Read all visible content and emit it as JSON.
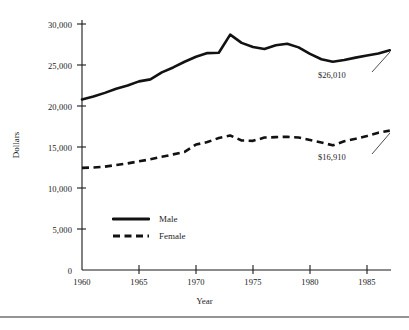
{
  "chart_data": {
    "type": "line",
    "title": "",
    "xlabel": "Year",
    "ylabel": "Dollars",
    "xlim": [
      1960,
      1987
    ],
    "ylim": [
      0,
      31000
    ],
    "grid": false,
    "legend_position": "inside-lower-left",
    "x": [
      1960,
      1961,
      1962,
      1963,
      1964,
      1965,
      1966,
      1967,
      1968,
      1969,
      1970,
      1971,
      1972,
      1973,
      1974,
      1975,
      1976,
      1977,
      1978,
      1979,
      1980,
      1981,
      1982,
      1983,
      1984,
      1985,
      1986,
      1987
    ],
    "series": [
      {
        "name": "Male",
        "style": "solid",
        "values": [
          20800,
          21150,
          21600,
          22100,
          22500,
          23000,
          23250,
          24100,
          24700,
          25400,
          26000,
          26450,
          26500,
          28700,
          27700,
          27200,
          26950,
          27400,
          27600,
          27150,
          26350,
          25700,
          25400,
          25600,
          25900,
          26150,
          26400,
          26800
        ]
      },
      {
        "name": "Female",
        "style": "dashed",
        "values": [
          12450,
          12500,
          12600,
          12800,
          13000,
          13250,
          13500,
          13800,
          14100,
          14400,
          15300,
          15600,
          16100,
          16400,
          15800,
          15750,
          16150,
          16200,
          16250,
          16150,
          15850,
          15550,
          15200,
          15700,
          16000,
          16350,
          16750,
          17000
        ]
      }
    ],
    "yticks": [
      {
        "value": 0,
        "label": "0"
      },
      {
        "value": 5000,
        "label": "5,000"
      },
      {
        "value": 10000,
        "label": "10,000"
      },
      {
        "value": 15000,
        "label": "15,000"
      },
      {
        "value": 20000,
        "label": "20,000"
      },
      {
        "value": 25000,
        "label": "25,000"
      },
      {
        "value": 30000,
        "label": "30,000"
      }
    ],
    "xticks": [
      {
        "value": 1960,
        "label": "1960"
      },
      {
        "value": 1965,
        "label": "1965"
      },
      {
        "value": 1970,
        "label": "1970"
      },
      {
        "value": 1975,
        "label": "1975"
      },
      {
        "value": 1980,
        "label": "1980"
      },
      {
        "value": 1985,
        "label": "1985"
      }
    ],
    "annotations": [
      {
        "id": "male-end",
        "text": "$26,010",
        "series": "Male",
        "points_to_year": 1987
      },
      {
        "id": "female-end",
        "text": "$16,910",
        "series": "Female",
        "points_to_year": 1987
      }
    ],
    "legend": [
      {
        "label": "Male",
        "style": "solid"
      },
      {
        "label": "Female",
        "style": "dashed"
      }
    ],
    "colors": {
      "series_male": "#121212",
      "series_female": "#121212",
      "axis": "#1a1a1a",
      "text": "#1f1f1f",
      "background": "#ffffff"
    }
  }
}
